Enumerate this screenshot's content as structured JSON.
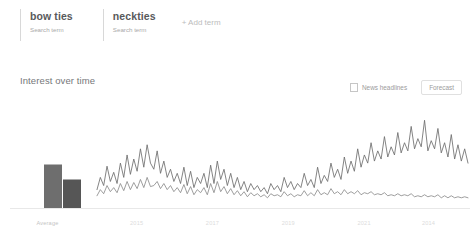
{
  "header": {
    "terms": [
      {
        "title": "bow ties",
        "subtitle": "Search term"
      },
      {
        "title": "neckties",
        "subtitle": "Search term"
      }
    ],
    "add_term_label": "+ Add term"
  },
  "section": {
    "title": "Interest over time",
    "news_headlines_label": "News headlines",
    "news_headlines_checked": false,
    "forecast_label": "Forecast"
  },
  "colors": {
    "series_bow_ties": "#6e6e6e",
    "series_neckties": "#8c8c8c",
    "bar_bow_ties": "#6e6e6e",
    "bar_neckties": "#565656",
    "axis": "#e8e8e8",
    "text_muted": "#a9a9a9"
  },
  "chart_data": [
    {
      "type": "bar",
      "title": "Average",
      "xlabel": "Average",
      "ylabel": "",
      "categories": [
        "bow ties",
        "neckties"
      ],
      "series": [
        {
          "name": "bow ties",
          "values": [
            58
          ]
        },
        {
          "name": "neckties",
          "values": [
            38
          ]
        }
      ],
      "values": [
        58,
        38
      ],
      "ylim": [
        0,
        100
      ],
      "grid": false,
      "legend": "none"
    },
    {
      "type": "line",
      "title": "Interest over time",
      "xlabel": "",
      "ylabel": "",
      "ylim": [
        0,
        100
      ],
      "grid": false,
      "legend": "none",
      "xtick_labels": [
        "2015",
        "2017",
        "2019",
        "2021",
        "2014"
      ],
      "xtick_positions_pct": [
        11,
        31,
        51,
        71,
        88
      ],
      "series": [
        {
          "name": "bow ties",
          "color": "#6e6e6e",
          "values": [
            18,
            30,
            22,
            41,
            26,
            35,
            24,
            44,
            30,
            52,
            33,
            48,
            36,
            58,
            40,
            62,
            44,
            38,
            56,
            34,
            46,
            30,
            38,
            26,
            34,
            24,
            40,
            22,
            36,
            20,
            30,
            24,
            34,
            20,
            42,
            24,
            46,
            28,
            38,
            22,
            34,
            20,
            30,
            18,
            26,
            16,
            24,
            18,
            22,
            16,
            20,
            14,
            24,
            18,
            22,
            16,
            30,
            20,
            26,
            18,
            24,
            20,
            34,
            22,
            28,
            20,
            40,
            24,
            32,
            26,
            44,
            30,
            38,
            28,
            50,
            34,
            46,
            36,
            58,
            40,
            52,
            44,
            64,
            46,
            56,
            48,
            70,
            50,
            60,
            52,
            74,
            54,
            64,
            56,
            80,
            58,
            68,
            60,
            86,
            56,
            66,
            58,
            78,
            54,
            64,
            50,
            72,
            48,
            62,
            46,
            58,
            44
          ]
        },
        {
          "name": "neckties",
          "color": "#8c8c8c",
          "values": [
            12,
            18,
            14,
            22,
            16,
            20,
            15,
            24,
            17,
            26,
            18,
            25,
            19,
            28,
            20,
            30,
            21,
            22,
            26,
            19,
            24,
            18,
            22,
            16,
            20,
            15,
            23,
            14,
            21,
            13,
            18,
            15,
            20,
            13,
            24,
            15,
            26,
            16,
            21,
            14,
            19,
            13,
            17,
            12,
            16,
            11,
            15,
            12,
            14,
            11,
            13,
            10,
            14,
            12,
            13,
            11,
            16,
            12,
            14,
            11,
            13,
            12,
            17,
            12,
            15,
            12,
            18,
            13,
            15,
            13,
            19,
            14,
            16,
            13,
            18,
            14,
            16,
            14,
            17,
            13,
            15,
            14,
            16,
            13,
            14,
            13,
            15,
            12,
            13,
            12,
            14,
            12,
            13,
            12,
            14,
            11,
            12,
            11,
            13,
            11,
            12,
            11,
            13,
            10,
            12,
            10,
            12,
            10,
            11,
            10,
            11,
            10
          ]
        }
      ]
    }
  ]
}
